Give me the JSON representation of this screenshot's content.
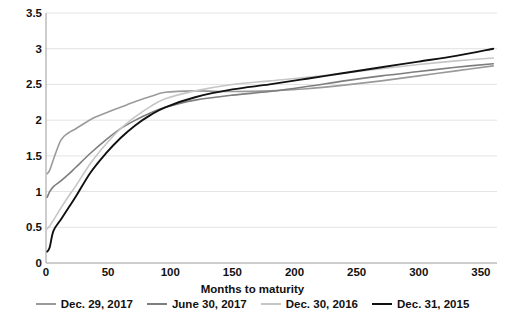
{
  "chart_data": {
    "type": "line",
    "title": "",
    "xlabel": "Months to maturity",
    "ylabel": "Yield percent per year",
    "xlim": [
      0,
      363
    ],
    "ylim": [
      0,
      3.5
    ],
    "xticks": [
      0,
      50,
      100,
      150,
      200,
      250,
      300,
      350
    ],
    "yticks": [
      0,
      0.5,
      1,
      1.5,
      2,
      2.5,
      3,
      3.5
    ],
    "ytick_labels": [
      "0",
      "0.5",
      "1",
      "1.5",
      "2",
      "2.5",
      "3",
      "3.5"
    ],
    "xtick_labels": [
      "0",
      "50",
      "100",
      "150",
      "200",
      "250",
      "300",
      "350"
    ],
    "grid": "horizontal",
    "legend_position": "bottom",
    "series": [
      {
        "name": "Dec. 29, 2017",
        "color": "#9a9a9a",
        "width": 1.6,
        "x": [
          1,
          3,
          6,
          12,
          18,
          24,
          36,
          48,
          60,
          72,
          84,
          96,
          120,
          150,
          180,
          210,
          240,
          270,
          300,
          330,
          360
        ],
        "y": [
          1.25,
          1.3,
          1.45,
          1.72,
          1.82,
          1.88,
          2.01,
          2.1,
          2.18,
          2.26,
          2.33,
          2.39,
          2.41,
          2.4,
          2.41,
          2.44,
          2.49,
          2.55,
          2.62,
          2.69,
          2.76
        ]
      },
      {
        "name": "June 30, 2017",
        "color": "#7e7e7e",
        "width": 1.6,
        "x": [
          1,
          3,
          6,
          12,
          18,
          24,
          36,
          48,
          60,
          72,
          84,
          96,
          120,
          150,
          180,
          210,
          240,
          270,
          300,
          330,
          360
        ],
        "y": [
          0.92,
          1.0,
          1.07,
          1.15,
          1.24,
          1.34,
          1.54,
          1.72,
          1.88,
          2.0,
          2.1,
          2.18,
          2.28,
          2.35,
          2.4,
          2.47,
          2.55,
          2.62,
          2.68,
          2.74,
          2.79
        ]
      },
      {
        "name": "Dec. 30, 2016",
        "color": "#c6c6c6",
        "width": 1.6,
        "x": [
          1,
          3,
          6,
          12,
          18,
          24,
          36,
          48,
          60,
          72,
          84,
          96,
          120,
          150,
          180,
          210,
          240,
          270,
          300,
          330,
          360
        ],
        "y": [
          0.48,
          0.52,
          0.6,
          0.77,
          0.93,
          1.08,
          1.4,
          1.66,
          1.88,
          2.05,
          2.19,
          2.3,
          2.41,
          2.5,
          2.55,
          2.6,
          2.66,
          2.72,
          2.78,
          2.83,
          2.87
        ]
      },
      {
        "name": "Dec. 31, 2015",
        "color": "#111111",
        "width": 1.9,
        "x": [
          1,
          3,
          6,
          12,
          18,
          24,
          36,
          48,
          60,
          72,
          84,
          96,
          120,
          150,
          180,
          210,
          240,
          270,
          300,
          330,
          360
        ],
        "y": [
          0.16,
          0.22,
          0.45,
          0.61,
          0.77,
          0.93,
          1.27,
          1.53,
          1.75,
          1.93,
          2.07,
          2.18,
          2.32,
          2.43,
          2.5,
          2.58,
          2.66,
          2.74,
          2.82,
          2.9,
          3.0
        ]
      }
    ]
  }
}
